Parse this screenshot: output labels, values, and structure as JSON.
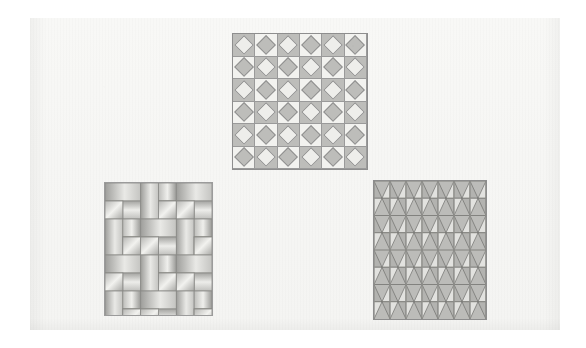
{
  "figure": {
    "background_color": "#ffffff",
    "page_color": "#f7f7f5",
    "page_rect": {
      "x": 30,
      "y": 18,
      "w": 530,
      "h": 312
    },
    "caption": "",
    "panel_count": 3
  },
  "patterns": [
    {
      "id": "diamond-grid",
      "name": "Diamond-in-square checkerboard tiling",
      "position": "top-center",
      "rect": {
        "x": 232,
        "y": 33,
        "w": 136,
        "h": 137
      },
      "rows": 6,
      "cols": 6,
      "cell_w": 22.7,
      "cell_h": 22.8,
      "motif": "square with inscribed rotated square (diamond)",
      "tone_rule": "checkerboard; diamond tone inverted relative to its cell",
      "colors": {
        "cell_dark": "#bdbdba",
        "cell_light": "#f2f2ef",
        "diamond_on_dark": "#eeeeeb",
        "diamond_on_light": "#bdbdba",
        "stroke": "#8f8f8f",
        "border": "#8e8e8e"
      },
      "diamond_scale": 0.66
    },
    {
      "id": "basketweave",
      "name": "Basketweave / pinwheel rectangle tiling",
      "position": "bottom-left",
      "rect": {
        "x": 104,
        "y": 182,
        "w": 109,
        "h": 134
      },
      "unit_blocks_x": 3,
      "unit_blocks_y": 4,
      "block_size": 36,
      "brick_long": 36,
      "brick_short": 18,
      "shading": "linear gradient per tile, direction alternating",
      "colors": {
        "tile_light": "#f4f4f1",
        "tile_mid": "#cfcfcc",
        "tile_dark": "#9c9c99",
        "stroke": "#8a8a87",
        "border": "#9b9b9b",
        "background": "#efefec"
      }
    },
    {
      "id": "rhombus-lattice",
      "name": "Elongated rhombus (diamond) lattice with triangular shading",
      "position": "bottom-right",
      "rect": {
        "x": 373,
        "y": 180,
        "w": 114,
        "h": 140
      },
      "rows": 4,
      "cols": 7,
      "cell_w": 16.3,
      "cell_h": 35,
      "motif": "vertical elongated rhombus bisected by a vertical midline, forming four triangles",
      "colors": {
        "field": "#bcbcb9",
        "triangle_light": "#e2e2df",
        "triangle_mid": "#b3b3b0",
        "triangle_dark": "#9a9a97",
        "stroke": "#6f6f6c",
        "rowline": "#7a7a77",
        "border": "#8d8d8d"
      }
    }
  ]
}
